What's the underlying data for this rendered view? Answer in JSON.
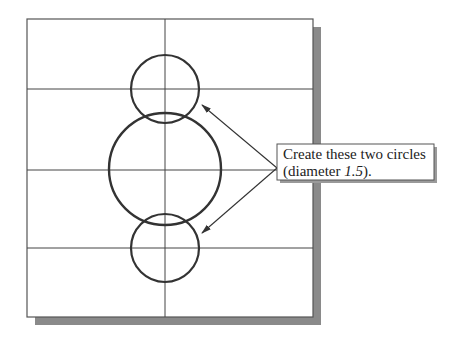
{
  "diagram": {
    "type": "cad-sketch-instruction",
    "grid": {
      "vertical_lines": 1,
      "horizontal_lines": 3
    },
    "circles": [
      {
        "name": "top-circle",
        "role": "to-create",
        "diameter": 1.5
      },
      {
        "name": "center-circle",
        "role": "existing"
      },
      {
        "name": "bottom-circle",
        "role": "to-create",
        "diameter": 1.5
      }
    ],
    "callout": {
      "line1": "Create these two circles",
      "line2_prefix": "(diameter ",
      "line2_value": "1.5",
      "line2_suffix": ")."
    },
    "colors": {
      "frame": "#555555",
      "shadow": "#8a8a8a",
      "grid": "#444444",
      "circle": "#333333",
      "arrow": "#333333",
      "callout_border": "#555555",
      "callout_bg": "#ffffff"
    }
  }
}
